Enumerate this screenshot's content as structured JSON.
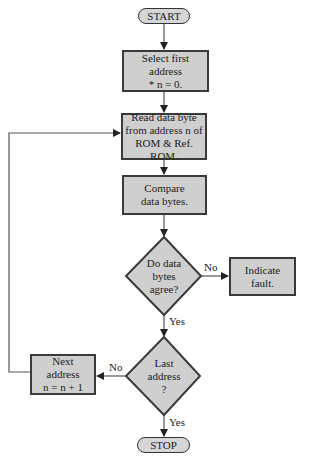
{
  "flowchart": {
    "start": {
      "label": "START"
    },
    "select_first": {
      "line1": "Select first",
      "line2": "address",
      "line3": "* n = 0."
    },
    "read_byte": {
      "line1": "Read data byte",
      "line2": "from address n of",
      "line3": "ROM & Ref. ROM."
    },
    "compare": {
      "line1": "Compare",
      "line2": "data bytes."
    },
    "decision_agree": {
      "line1": "Do data",
      "line2": "bytes",
      "line3": "agree?"
    },
    "indicate_fault": {
      "line1": "Indicate",
      "line2": "fault."
    },
    "decision_last": {
      "line1": "Last",
      "line2": "address",
      "line3": "?"
    },
    "next_address": {
      "line1": "Next",
      "line2": "address",
      "line3": "n = n + 1"
    },
    "stop": {
      "label": "STOP"
    },
    "edge_labels": {
      "agree_no": "No",
      "agree_yes": "Yes",
      "last_no": "No",
      "last_yes": "Yes"
    },
    "colors": {
      "fill": "#cfcfcf",
      "stroke": "#3a3a3a",
      "line": "#555555"
    }
  }
}
